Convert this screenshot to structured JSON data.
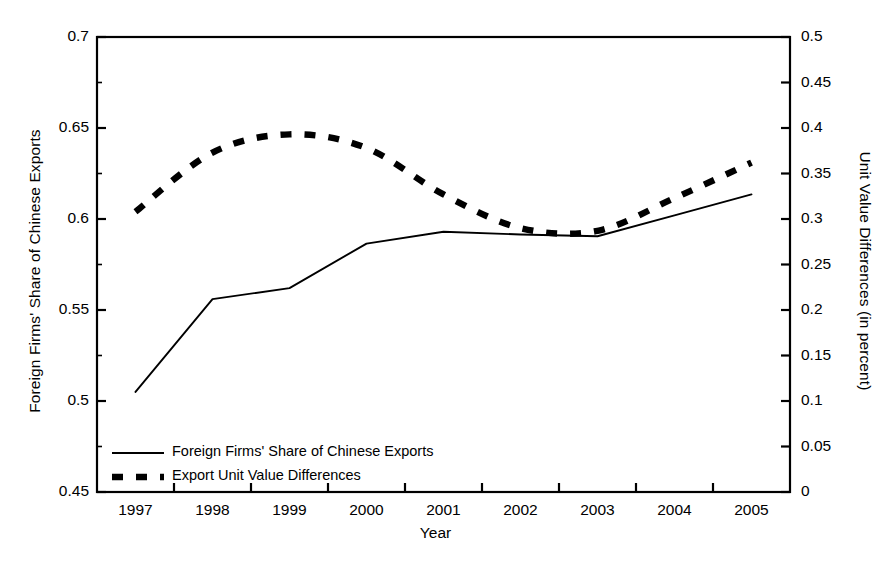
{
  "chart_data": {
    "type": "line",
    "title": "",
    "xlabel": "Year",
    "grid": false,
    "legend_position": "inside-bottom-left",
    "categories": [
      "1997",
      "1998",
      "1999",
      "2000",
      "2001",
      "2002",
      "2003",
      "2004",
      "2005"
    ],
    "axes": {
      "left": {
        "label": "Foreign Firms' Share of Chinese Exports",
        "ylim": [
          0.45,
          0.7
        ],
        "ticks": [
          0.45,
          0.5,
          0.55,
          0.6,
          0.65,
          0.7
        ],
        "tick_labels": [
          "0.45",
          "0.5",
          "0.55",
          "0.6",
          "0.65",
          "0.7"
        ],
        "minor_tick_step": 0.025
      },
      "right": {
        "label": "Unit Value Differences (in percent)",
        "ylim": [
          0,
          0.5
        ],
        "ticks": [
          0,
          0.05,
          0.1,
          0.15,
          0.2,
          0.25,
          0.3,
          0.35,
          0.4,
          0.45,
          0.5
        ],
        "tick_labels": [
          "0",
          "0.05",
          "0.1",
          "0.15",
          "0.2",
          "0.25",
          "0.3",
          "0.35",
          "0.4",
          "0.45",
          "0.5"
        ]
      }
    },
    "series": [
      {
        "name": "Foreign Firms' Share of Chinese Exports",
        "axis": "left",
        "style": "solid",
        "color": "#000000",
        "values": [
          0.505,
          0.556,
          0.562,
          0.5865,
          0.593,
          0.5915,
          0.5905,
          0.602,
          0.6135
        ]
      },
      {
        "name": "Export Unit Value Differences",
        "axis": "right",
        "style": "dashed",
        "color": "#000000",
        "values": [
          0.308,
          0.373,
          0.393,
          0.378,
          0.327,
          0.29,
          0.287,
          0.323,
          0.362
        ]
      }
    ]
  },
  "legend": {
    "items": [
      {
        "label": "Foreign Firms' Share of Chinese Exports",
        "style": "solid"
      },
      {
        "label": "Export Unit Value Differences",
        "style": "dashed"
      }
    ]
  }
}
